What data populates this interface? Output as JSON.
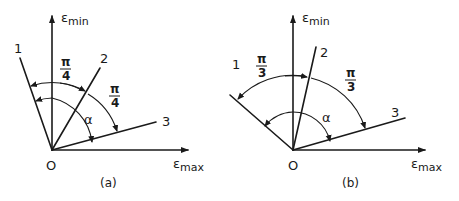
{
  "figure": {
    "panels": [
      {
        "id": "a",
        "caption": "(a)",
        "origin_label": "O",
        "y_axis": {
          "symbol": "ε",
          "subscript": "min"
        },
        "x_axis": {
          "symbol": "ε",
          "subscript": "max"
        },
        "lines": [
          {
            "label": "1"
          },
          {
            "label": "2"
          },
          {
            "label": "3"
          }
        ],
        "angles": [
          {
            "num": "π",
            "den": "4"
          },
          {
            "num": "π",
            "den": "4"
          }
        ],
        "alpha_label": "α"
      },
      {
        "id": "b",
        "caption": "(b)",
        "origin_label": "O",
        "y_axis": {
          "symbol": "ε",
          "subscript": "min"
        },
        "x_axis": {
          "symbol": "ε",
          "subscript": "max"
        },
        "lines": [
          {
            "label": "1"
          },
          {
            "label": "2"
          },
          {
            "label": "3"
          }
        ],
        "angles": [
          {
            "num": "π",
            "den": "3"
          },
          {
            "num": "π",
            "den": "3"
          }
        ],
        "alpha_label": "α"
      }
    ]
  }
}
